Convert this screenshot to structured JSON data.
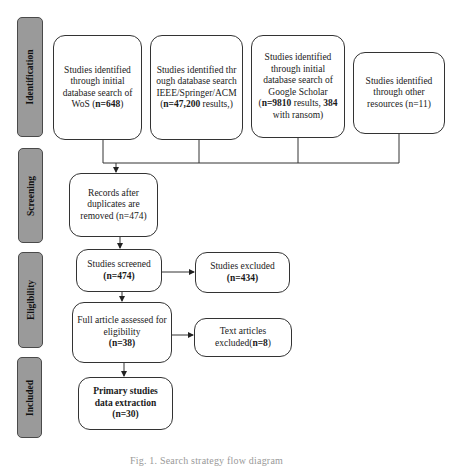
{
  "phases": [
    {
      "id": "identification",
      "label": "Identification"
    },
    {
      "id": "screening",
      "label": "Screening"
    },
    {
      "id": "eligibility",
      "label": "Eligibility"
    },
    {
      "id": "included",
      "label": "Included"
    }
  ],
  "boxes": {
    "wos": {
      "pre": "Studies identified through initial database search of WoS (",
      "bold": "n=648",
      "post": ")"
    },
    "ieee": {
      "pre": "Studies identified through database search IEEE/Springer/ACM (",
      "bold": "n=47,200",
      "post": " results,)"
    },
    "google": {
      "pre": "Studies identified through initial database search of Google Scholar (",
      "bold": "n=9810",
      "mid": " results, ",
      "bold2": "384",
      "post": " with ransom)"
    },
    "other": {
      "pre": "Studies identified through other resources (n=11)"
    },
    "records": {
      "pre": "Records after duplicates are removed (n=474)"
    },
    "screened": {
      "pre": "Studies screened",
      "bold": "(n=474)"
    },
    "excluded": {
      "pre": "Studies excluded",
      "bold": "(n=434)"
    },
    "full_article": {
      "pre": "Full article assessed for eligibility",
      "bold": "(n=38)"
    },
    "text_excluded": {
      "pre": "Text articles excluded(",
      "bold": "n=8",
      "post": ")"
    },
    "primary": {
      "pre": "Primary studies data extraction (n=30)"
    }
  },
  "caption": "Fig. 1. Search strategy flow diagram"
}
